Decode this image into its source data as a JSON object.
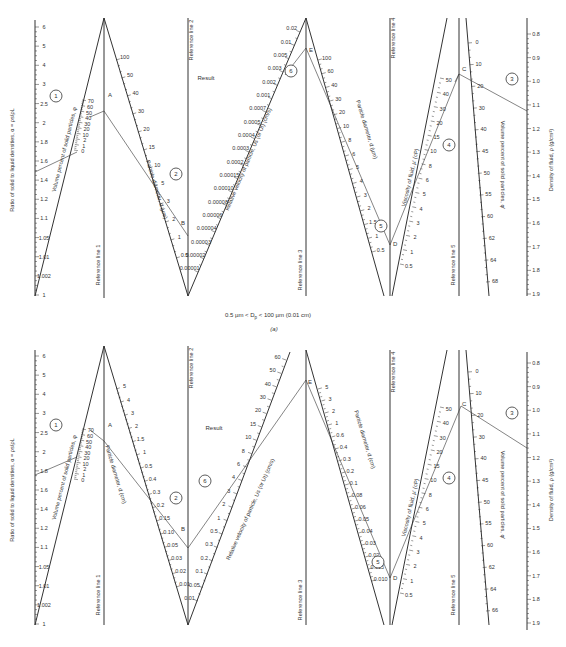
{
  "figure": {
    "caption_a": "0.5 µm < D",
    "caption_a_sub": "p",
    "caption_a_rest": " < 100 µm (0.01 cm)",
    "panel_a": "(a)",
    "panels": [
      {
        "id": "a",
        "axis_alpha_label": "Ratio of solid to liquid densities, α = ρs/ρL",
        "axis_alpha_ticks": [
          "6",
          "5",
          "4",
          "3",
          "2.5",
          "2",
          "1.8",
          "1.6",
          "1.4",
          "1.2",
          "1.1",
          "1.05",
          "1.01",
          "1.002",
          "1"
        ],
        "volume_label": "Volume percent of solid particles, φ",
        "volume_ticks": [
          "70",
          "60",
          "50",
          "40",
          "30",
          "20",
          "10",
          "2",
          "1",
          "0"
        ],
        "ref1": "Reference line 1",
        "ref2": "Reference line 2",
        "ref3": "Reference line 3",
        "ref4": "Reference line 4",
        "ref5": "Reference line 5",
        "diam_label": "Particle diameter, d (µm)",
        "diam_ticks": [
          "100",
          "50",
          "40",
          "30",
          "20",
          "15",
          "10",
          "5",
          "3",
          "2",
          "1",
          "0.5"
        ],
        "result_label": "Result",
        "velocity_label": "Relative velocity of particle, Us (or Ut) (cm/s)",
        "velocity_ticks": [
          "0.02",
          "0.01",
          "0.005",
          "0.003",
          "0.002",
          "0.001",
          "0.0007",
          "0.0005",
          "0.0004",
          "0.0003",
          "0.0002",
          "0.00015",
          "0.00010",
          "0.00008",
          "0.00006",
          "0.00004",
          "0.00003",
          "0.00002",
          "0.00001"
        ],
        "diam2_label": "Particle diameter, d (µm)",
        "diam2_ticks": [
          "100",
          "60",
          "40",
          "30",
          "20",
          "10",
          "8",
          "6",
          "5",
          "4",
          "3",
          "2",
          "1.5",
          "1",
          "0.5"
        ],
        "visc_label": "Viscosity of fluid, µ' (cP)",
        "visc_ticks": [
          "50",
          "40",
          "30",
          "20",
          "15",
          "10",
          "8",
          "6",
          "5",
          "4",
          "3",
          "2",
          "1",
          "0.5"
        ],
        "vol2_label": "Volume percent of solid particles, φ'",
        "vol2_ticks": [
          "0",
          "10",
          "20",
          "30",
          "40",
          "45",
          "50",
          "55",
          "60",
          "62",
          "64",
          "68"
        ],
        "density_label": "Density of fluid, ρ (g/cm³)",
        "density_ticks": [
          "0.8",
          "0.9",
          "1.0",
          "1.1",
          "1.2",
          "1.3",
          "1.4",
          "1.5",
          "1.6",
          "1.7",
          "1.8",
          "1.9"
        ],
        "points": [
          "A",
          "B",
          "C",
          "D",
          "E"
        ],
        "steps": [
          "1",
          "2",
          "3",
          "4",
          "5",
          "6"
        ]
      },
      {
        "id": "b",
        "axis_alpha_label": "Ratio of solid to liquid densities, α = ρs/ρL",
        "axis_alpha_ticks": [
          "6",
          "5",
          "4",
          "3",
          "2.5",
          "2",
          "1.8",
          "1.6",
          "1.4",
          "1.2",
          "1.1",
          "1.05",
          "1.01",
          "1.002",
          "1"
        ],
        "volume_label": "Volume percent of solid particles, φ",
        "volume_ticks": [
          "70",
          "60",
          "50",
          "40",
          "30",
          "20",
          "10",
          "2",
          "1",
          "0"
        ],
        "ref1": "Reference line 1",
        "ref2": "Reference line 2",
        "ref3": "Reference line 3",
        "ref4": "Reference line 4",
        "ref5": "Reference line 5",
        "diam_label": "Particle diameter, d (cm)",
        "diam_ticks": [
          "5",
          "4",
          "3",
          "2",
          "1.5",
          "1",
          "0.5",
          "0.4",
          "0.3",
          "0.2",
          "0.15",
          "0.10",
          "0.05",
          "0.03",
          "0.02",
          "0.01"
        ],
        "result_label": "Result",
        "velocity_label": "Relative velocity of particle, Us (or Ut) (cm/s)",
        "velocity_ticks": [
          "60",
          "50",
          "40",
          "30",
          "20",
          "15",
          "10",
          "8",
          "6",
          "4",
          "3",
          "2",
          "1",
          "0.5",
          "0.3",
          "0.2",
          "0.1",
          "0.05",
          "0.01"
        ],
        "diam2_label": "Particle diameter, d (cm)",
        "diam2_ticks": [
          "5",
          "3",
          "2",
          "1",
          "0.6",
          "0.4",
          "0.3",
          "0.2",
          "0.1",
          "0.08",
          "0.06",
          "0.05",
          "0.04",
          "0.03",
          "0.02",
          "0.015",
          "0.010"
        ],
        "visc_label": "Viscosity of fluid, µ' (cP)",
        "visc_ticks": [
          "50",
          "40",
          "30",
          "20",
          "15",
          "10",
          "8",
          "6",
          "5",
          "4",
          "3",
          "2",
          "1",
          "0.5"
        ],
        "vol2_label": "Volume percent of solid particles, φ'",
        "vol2_ticks": [
          "0",
          "10",
          "20",
          "30",
          "40",
          "45",
          "50",
          "55",
          "60",
          "62",
          "64",
          "66"
        ],
        "density_label": "Density of fluid, ρ (g/cm³)",
        "density_ticks": [
          "0.8",
          "0.9",
          "1.0",
          "1.1",
          "1.2",
          "1.3",
          "1.4",
          "1.5",
          "1.6",
          "1.7",
          "1.8",
          "1.9"
        ],
        "points": [
          "A",
          "B",
          "C",
          "D",
          "E"
        ],
        "steps": [
          "1",
          "2",
          "3",
          "4",
          "5",
          "6"
        ]
      }
    ]
  }
}
